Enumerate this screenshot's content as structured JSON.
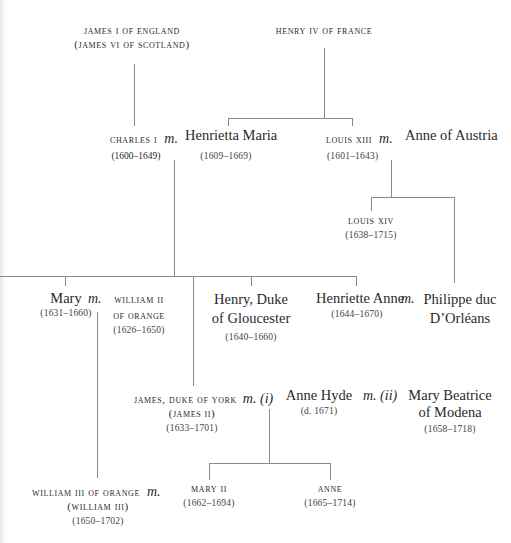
{
  "diagram_type": "family-tree",
  "marriage_marker": "m.",
  "people": {
    "james_i": {
      "name": "James I of England",
      "alt": "(James VI of Scotland)"
    },
    "henry_iv": {
      "name": "Henry IV of France"
    },
    "charles_i": {
      "name": "Charles I",
      "dates": "(1600–1649)"
    },
    "henrietta_maria": {
      "name": "Henrietta Maria",
      "dates": "(1609–1669)"
    },
    "louis_xiii": {
      "name": "Louis XIII",
      "dates": "(1601–1643)"
    },
    "anne_of_austria": {
      "name": "Anne of Austria"
    },
    "louis_xiv": {
      "name": "Louis XIV",
      "dates": "(1638–1715)"
    },
    "mary": {
      "name": "Mary",
      "dates": "(1631–1660)"
    },
    "william_ii": {
      "name_line1": "William II",
      "name_line2": "of Orange",
      "dates": "(1626–1650)"
    },
    "henry_gloucester": {
      "name_line1": "Henry, Duke",
      "name_line2": "of Gloucester",
      "dates": "(1640–1660)"
    },
    "henriette_anne": {
      "name": "Henriette Anne",
      "dates": "(1644–1670)"
    },
    "philippe": {
      "name_line1": "Philippe duc",
      "name_line2": "D’Orléans"
    },
    "james_ii": {
      "name": "James, Duke of York",
      "alt": "(James II)",
      "dates": "(1633–1701)"
    },
    "anne_hyde": {
      "marker": "m. (i)",
      "name": "Anne Hyde",
      "dates": "(d. 1671)"
    },
    "mary_beatrice": {
      "marker": "m. (ii)",
      "name_line1": "Mary Beatrice",
      "name_line2": "of Modena",
      "dates": "(1658–1718)"
    },
    "william_iii": {
      "name": "William III of Orange",
      "alt": "(William III)",
      "dates": "(1650–1702)"
    },
    "mary_ii": {
      "name": "Mary II",
      "dates": "(1662–1694)"
    },
    "anne": {
      "name": "Anne",
      "dates": "(1665–1714)"
    }
  },
  "relationships": [
    {
      "type": "parent-child",
      "parent": "james_i",
      "child": "charles_i"
    },
    {
      "type": "parent-child",
      "parent": "henry_iv",
      "child": "henrietta_maria"
    },
    {
      "type": "parent-child",
      "parent": "henry_iv",
      "child": "louis_xiii"
    },
    {
      "type": "marriage",
      "a": "charles_i",
      "b": "henrietta_maria"
    },
    {
      "type": "marriage",
      "a": "louis_xiii",
      "b": "anne_of_austria"
    },
    {
      "type": "parent-child",
      "parent": "louis_xiii",
      "child": "louis_xiv"
    },
    {
      "type": "parent-child",
      "parent": "louis_xiii",
      "child": "philippe"
    },
    {
      "type": "parent-child",
      "parent": "charles_i",
      "child": "mary"
    },
    {
      "type": "parent-child",
      "parent": "charles_i",
      "child": "james_ii"
    },
    {
      "type": "parent-child",
      "parent": "charles_i",
      "child": "henry_gloucester"
    },
    {
      "type": "parent-child",
      "parent": "charles_i",
      "child": "henriette_anne"
    },
    {
      "type": "marriage",
      "a": "mary",
      "b": "william_ii"
    },
    {
      "type": "marriage",
      "a": "henriette_anne",
      "b": "philippe"
    },
    {
      "type": "marriage",
      "a": "james_ii",
      "b": "anne_hyde"
    },
    {
      "type": "marriage",
      "a": "james_ii",
      "b": "mary_beatrice"
    },
    {
      "type": "parent-child",
      "parent": "mary",
      "child": "william_iii"
    },
    {
      "type": "parent-child",
      "parent": "james_ii",
      "child": "mary_ii"
    },
    {
      "type": "parent-child",
      "parent": "james_ii",
      "child": "anne"
    },
    {
      "type": "marriage",
      "a": "william_iii",
      "b": "mary_ii"
    }
  ]
}
